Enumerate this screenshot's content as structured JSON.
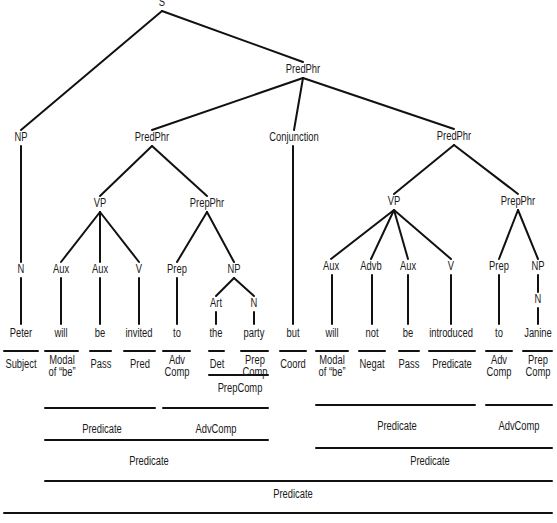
{
  "diagram": {
    "type": "syntax-tree",
    "sentence": "Peter will be invited to the party but will not be introduced to Janine",
    "nodes": [
      {
        "id": "S",
        "label": "S",
        "x": 162,
        "y": -4
      },
      {
        "id": "PredPhr_top",
        "label": "PredPhr",
        "x": 303,
        "y": 63
      },
      {
        "id": "NP_subj",
        "label": "NP",
        "x": 21,
        "y": 131
      },
      {
        "id": "PredPhr_left",
        "label": "PredPhr",
        "x": 152,
        "y": 131
      },
      {
        "id": "Conjunction",
        "label": "Conjunction",
        "x": 294,
        "y": 131
      },
      {
        "id": "PredPhr_right",
        "label": "PredPhr",
        "x": 454,
        "y": 130
      },
      {
        "id": "VP_left",
        "label": "VP",
        "x": 100,
        "y": 197
      },
      {
        "id": "PrepPhr_left",
        "label": "PrepPhr",
        "x": 207,
        "y": 197
      },
      {
        "id": "VP_right",
        "label": "VP",
        "x": 394,
        "y": 195
      },
      {
        "id": "PrepPhr_right",
        "label": "PrepPhr",
        "x": 518,
        "y": 195
      },
      {
        "id": "N_subj",
        "label": "N",
        "x": 21,
        "y": 263
      },
      {
        "id": "Aux_1",
        "label": "Aux",
        "x": 61,
        "y": 263
      },
      {
        "id": "Aux_2",
        "label": "Aux",
        "x": 100,
        "y": 263
      },
      {
        "id": "V_1",
        "label": "V",
        "x": 139,
        "y": 263
      },
      {
        "id": "Prep_1",
        "label": "Prep",
        "x": 177,
        "y": 263
      },
      {
        "id": "NP_obj1",
        "label": "NP",
        "x": 234,
        "y": 263
      },
      {
        "id": "Art",
        "label": "Art",
        "x": 216,
        "y": 297
      },
      {
        "id": "N_party",
        "label": "N",
        "x": 254,
        "y": 297
      },
      {
        "id": "Aux_3",
        "label": "Aux",
        "x": 331,
        "y": 260
      },
      {
        "id": "Advb",
        "label": "Advb",
        "x": 371,
        "y": 260
      },
      {
        "id": "Aux_4",
        "label": "Aux",
        "x": 408,
        "y": 260
      },
      {
        "id": "V_2",
        "label": "V",
        "x": 451,
        "y": 260
      },
      {
        "id": "Prep_2",
        "label": "Prep",
        "x": 499,
        "y": 260
      },
      {
        "id": "NP_obj2",
        "label": "NP",
        "x": 538,
        "y": 260
      },
      {
        "id": "N_janine",
        "label": "N",
        "x": 538,
        "y": 293
      }
    ],
    "edges": [
      [
        "S",
        "NP_subj"
      ],
      [
        "S",
        "PredPhr_top"
      ],
      [
        "PredPhr_top",
        "PredPhr_left"
      ],
      [
        "PredPhr_top",
        "Conjunction"
      ],
      [
        "PredPhr_top",
        "PredPhr_right"
      ],
      [
        "PredPhr_left",
        "VP_left"
      ],
      [
        "PredPhr_left",
        "PrepPhr_left"
      ],
      [
        "VP_left",
        "Aux_1"
      ],
      [
        "VP_left",
        "Aux_2"
      ],
      [
        "VP_left",
        "V_1"
      ],
      [
        "PrepPhr_left",
        "Prep_1"
      ],
      [
        "PrepPhr_left",
        "NP_obj1"
      ],
      [
        "NP_obj1",
        "Art"
      ],
      [
        "NP_obj1",
        "N_party"
      ],
      [
        "PredPhr_right",
        "VP_right"
      ],
      [
        "PredPhr_right",
        "PrepPhr_right"
      ],
      [
        "VP_right",
        "Aux_3"
      ],
      [
        "VP_right",
        "Advb"
      ],
      [
        "VP_right",
        "Aux_4"
      ],
      [
        "VP_right",
        "V_2"
      ],
      [
        "PrepPhr_right",
        "Prep_2"
      ],
      [
        "PrepPhr_right",
        "NP_obj2"
      ]
    ],
    "words": [
      {
        "text": "Peter",
        "x": 21,
        "parent": "N_subj",
        "function": "Subject",
        "fx1": 4,
        "fx2": 38
      },
      {
        "text": "will",
        "x": 61,
        "parent": "Aux_1",
        "function": "Modal\nof “be”",
        "fx1": 45,
        "fx2": 78
      },
      {
        "text": "be",
        "x": 100,
        "parent": "Aux_2",
        "function": "Pass",
        "fx1": 90,
        "fx2": 111
      },
      {
        "text": "invited",
        "x": 139,
        "parent": "V_1",
        "function": "Pred",
        "fx1": 124,
        "fx2": 155
      },
      {
        "text": "to",
        "x": 177,
        "parent": "Prep_1",
        "function": "Adv\nComp",
        "fx1": 163,
        "fx2": 190
      },
      {
        "text": "the",
        "x": 216,
        "parent": "Art",
        "function": "Det",
        "fx1": 209,
        "fx2": 224
      },
      {
        "text": "party",
        "x": 254,
        "parent": "N_party",
        "function": "Prep\nComp",
        "fx1": 241,
        "fx2": 268
      },
      {
        "text": "but",
        "x": 293,
        "parent": "Conjunction",
        "function": "Coord",
        "fx1": 280,
        "fx2": 306
      },
      {
        "text": "will",
        "x": 332,
        "parent": "Aux_3",
        "function": "Modal\nof “be”",
        "fx1": 316,
        "fx2": 348
      },
      {
        "text": "not",
        "x": 372,
        "parent": "Advb",
        "function": "Negat",
        "fx1": 359,
        "fx2": 385
      },
      {
        "text": "be",
        "x": 408,
        "parent": "Aux_4",
        "function": "Pass",
        "fx1": 399,
        "fx2": 419
      },
      {
        "text": "introduced",
        "x": 451,
        "parent": "V_2",
        "function": "Predicate",
        "fx1": 429,
        "fx2": 475
      },
      {
        "text": "to",
        "x": 499,
        "parent": "Prep_2",
        "function": "Adv\nComp",
        "fx1": 486,
        "fx2": 512
      },
      {
        "text": "Janine",
        "x": 538,
        "parent": "N_janine",
        "function": "Prep\nComp",
        "fx1": 523,
        "fx2": 552
      }
    ],
    "functional_analysis": [
      {
        "label": "PrepComp",
        "x1": 209,
        "x2": 268,
        "line_y": 375,
        "label_y": 382,
        "label_x": 240
      },
      {
        "label": "Predicate",
        "x1": 45,
        "x2": 155,
        "line_y": 408,
        "label_y": 423,
        "label_x": 102
      },
      {
        "label": "AdvComp",
        "x1": 163,
        "x2": 268,
        "line_y": 408,
        "label_y": 423,
        "label_x": 216
      },
      {
        "label": "Predicate",
        "x1": 316,
        "x2": 475,
        "line_y": 405,
        "label_y": 420,
        "label_x": 397
      },
      {
        "label": "AdvComp",
        "x1": 486,
        "x2": 552,
        "line_y": 405,
        "label_y": 420,
        "label_x": 519
      },
      {
        "label": "Predicate",
        "x1": 45,
        "x2": 268,
        "line_y": 440,
        "label_y": 455,
        "label_x": 149
      },
      {
        "label": "Predicate",
        "x1": 316,
        "x2": 552,
        "line_y": 448,
        "label_y": 455,
        "label_x": 430
      },
      {
        "label": "Predicate",
        "x1": 45,
        "x2": 552,
        "line_y": 481,
        "label_y": 488,
        "label_x": 293
      },
      {
        "label": "",
        "x1": 4,
        "x2": 552,
        "line_y": 513,
        "label_y": 0,
        "label_x": 0
      }
    ]
  }
}
